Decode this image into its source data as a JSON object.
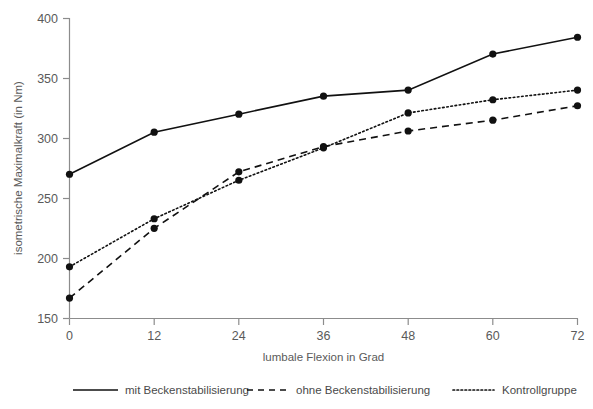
{
  "chart_data": {
    "type": "line",
    "title": "",
    "subtitle": "",
    "xlabel": "lumbale Flexion in Grad",
    "ylabel": "isometrische Maximalkraft (in Nm)",
    "x": [
      0,
      12,
      24,
      36,
      48,
      60,
      72
    ],
    "xticklabels": [
      "0",
      "12",
      "24",
      "36",
      "48",
      "60",
      "72"
    ],
    "yticklabels": [
      "150",
      "200",
      "250",
      "300",
      "350",
      "400"
    ],
    "yticks": [
      150,
      200,
      250,
      300,
      350,
      400
    ],
    "xlim": [
      0,
      72
    ],
    "ylim": [
      150,
      400
    ],
    "grid": false,
    "legend_position": "bottom",
    "markers": "filled-circle",
    "series": [
      {
        "name": "mit Beckenstabilisierung",
        "style": "solid",
        "color": "#111111",
        "values": [
          270,
          305,
          320,
          335,
          340,
          370,
          384
        ]
      },
      {
        "name": "ohne Beckenstabilisierung",
        "style": "dashed",
        "color": "#111111",
        "values": [
          167,
          225,
          272,
          293,
          306,
          315,
          327
        ]
      },
      {
        "name": "Kontrollgruppe",
        "style": "dotted",
        "color": "#111111",
        "values": [
          193,
          233,
          265,
          292,
          321,
          332,
          340
        ]
      }
    ]
  },
  "axes": {
    "x_title": "lumbale Flexion in Grad",
    "y_title": "isometrische Maximalkraft (in Nm)",
    "x_tick_labels": [
      "0",
      "12",
      "24",
      "36",
      "48",
      "60",
      "72"
    ],
    "y_tick_labels": [
      "150",
      "200",
      "250",
      "300",
      "350",
      "400"
    ]
  },
  "legend": {
    "entries": [
      {
        "label": "mit Beckenstabilisierung",
        "style": "solid"
      },
      {
        "label": "ohne Beckenstabilisierung",
        "style": "dashed"
      },
      {
        "label": "Kontrollgruppe",
        "style": "dotted"
      }
    ]
  },
  "colors": {
    "axis": "#8c8c8c",
    "text": "#5a5a5a",
    "series": "#111111",
    "background": "#ffffff"
  }
}
